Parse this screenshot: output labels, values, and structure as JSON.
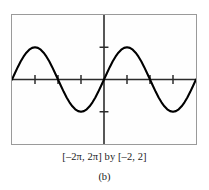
{
  "figure": {
    "panel_label": "(b)",
    "window_caption": "[–2π, 2π] by [–2, 2]",
    "frame_color": "#9a9a9a",
    "axis_color": "#1a1a1a",
    "curve_color": "#000000",
    "screen_background": "#fefefe"
  },
  "chart_data": {
    "type": "line",
    "title": "",
    "subtitle": "",
    "xlabel": "",
    "ylabel": "",
    "function": "y = sin x",
    "xlim": [
      -6.283185307,
      6.283185307
    ],
    "ylim": [
      -2,
      2
    ],
    "xlim_label": "[–2π, 2π]",
    "ylim_label": "[–2, 2]",
    "grid": false,
    "legend": "none",
    "axes": {
      "x_axis_at_y": 0,
      "y_axis_at_x": 0,
      "x_tick_spacing": 1.5707963268,
      "x_tick_spacing_label": "π/2",
      "y_tick_spacing": 1,
      "x_ticks": [
        -4.71238898,
        -3.141592654,
        -1.570796327,
        1.570796327,
        3.141592654,
        4.71238898
      ],
      "y_ticks": [
        -1,
        1
      ]
    },
    "series": [
      {
        "name": "y = sin x",
        "x": [
          -6.2832,
          -6.0868,
          -5.8905,
          -5.6941,
          -5.4978,
          -5.3014,
          -5.1051,
          -4.9087,
          -4.7124,
          -4.516,
          -4.3197,
          -4.1233,
          -3.927,
          -3.7306,
          -3.5343,
          -3.3379,
          -3.1416,
          -2.9452,
          -2.7489,
          -2.5525,
          -2.3562,
          -2.1598,
          -1.9635,
          -1.7671,
          -1.5708,
          -1.3744,
          -1.1781,
          -0.9817,
          -0.7854,
          -0.589,
          -0.3927,
          -0.1963,
          0.0,
          0.1963,
          0.3927,
          0.589,
          0.7854,
          0.9817,
          1.1781,
          1.3744,
          1.5708,
          1.7671,
          1.9635,
          2.1598,
          2.3562,
          2.5525,
          2.7489,
          2.9452,
          3.1416,
          3.3379,
          3.5343,
          3.7306,
          3.927,
          4.1233,
          4.3197,
          4.516,
          4.7124,
          4.9087,
          5.1051,
          5.3014,
          5.4978,
          5.6941,
          5.8905,
          6.0868,
          6.2832
        ],
        "y": [
          0.0,
          0.1951,
          0.3827,
          0.5556,
          0.7071,
          0.8315,
          0.9239,
          0.9808,
          1.0,
          0.9808,
          0.9239,
          0.8315,
          0.7071,
          0.5556,
          0.3827,
          0.1951,
          0.0,
          -0.1951,
          -0.3827,
          -0.5556,
          -0.7071,
          -0.8315,
          -0.9239,
          -0.9808,
          -1.0,
          -0.9808,
          -0.9239,
          -0.8315,
          -0.7071,
          -0.5556,
          -0.3827,
          -0.1951,
          0.0,
          0.1951,
          0.3827,
          0.5556,
          0.7071,
          0.8315,
          0.9239,
          0.9808,
          1.0,
          0.9808,
          0.9239,
          0.8315,
          0.7071,
          0.5556,
          0.3827,
          0.1951,
          0.0,
          -0.1951,
          -0.3827,
          -0.5556,
          -0.7071,
          -0.8315,
          -0.9239,
          -0.9808,
          -1.0,
          -0.9808,
          -0.9239,
          -0.8315,
          -0.7071,
          -0.5556,
          -0.3827,
          -0.1951,
          0.0
        ]
      }
    ]
  }
}
